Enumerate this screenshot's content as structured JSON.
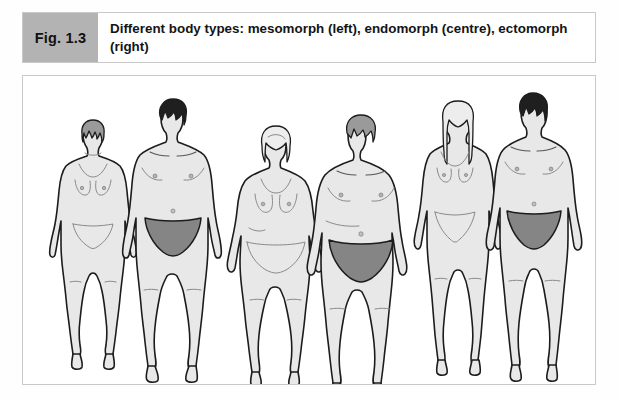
{
  "figure": {
    "label": "Fig. 1.3",
    "caption": "Different body types: mesomorph (left), endomorph (centre), ectomorph (right)",
    "label_background_color": "#b3b3b3",
    "frame_border_color": "#c9c9c9",
    "page_background_color": "#ffffff"
  },
  "illustration": {
    "description": "Six full-length front-view human body outlines arranged in three pairs",
    "body_fill_color": "#e8e8e8",
    "outline_color": "#1c1c1c",
    "briefs_color": "#858585",
    "groups": [
      {
        "name": "mesomorph-group",
        "body_type": "mesomorph",
        "position": "left",
        "figures": [
          {
            "name": "mesomorph-female",
            "sex": "female",
            "hair": "short",
            "hair_color": "#9a9a9a",
            "clothing": "one-piece swimsuit"
          },
          {
            "name": "mesomorph-male",
            "sex": "male",
            "hair": "short",
            "hair_color": "#1f1f1f",
            "clothing": "briefs"
          }
        ]
      },
      {
        "name": "endomorph-group",
        "body_type": "endomorph",
        "position": "centre",
        "figures": [
          {
            "name": "endomorph-female",
            "sex": "female",
            "hair": "medium",
            "hair_color": "#ededed",
            "clothing": "one-piece swimsuit"
          },
          {
            "name": "endomorph-male",
            "sex": "male",
            "hair": "short",
            "hair_color": "#9a9a9a",
            "clothing": "briefs"
          }
        ]
      },
      {
        "name": "ectomorph-group",
        "body_type": "ectomorph",
        "position": "right",
        "figures": [
          {
            "name": "ectomorph-female",
            "sex": "female",
            "hair": "long",
            "hair_color": "#ededed",
            "clothing": "one-piece swimsuit"
          },
          {
            "name": "ectomorph-male",
            "sex": "male",
            "hair": "short",
            "hair_color": "#1f1f1f",
            "clothing": "briefs"
          }
        ]
      }
    ]
  }
}
